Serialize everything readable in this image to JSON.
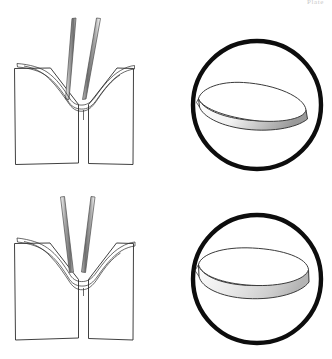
{
  "page": {
    "header_text": "Plate",
    "width": 332,
    "height": 359,
    "background_color": "#ffffff",
    "ink_color": "#2b2b2b",
    "outline_color": "#0d0d0d"
  },
  "figure": {
    "panels": [
      {
        "id": "panel-top-left",
        "name": "thin-lens-fold-diagram",
        "label": "",
        "description": "Forceps jaws folding a thin lens into a V between two blocks",
        "lens_thickness": "thin"
      },
      {
        "id": "panel-top-right",
        "name": "thin-lens-inset",
        "label": "",
        "description": "Circular inset showing oblique view of thin lens disc",
        "lens_thickness": "thin"
      },
      {
        "id": "panel-bottom-left",
        "name": "thick-lens-fold-diagram",
        "label": "",
        "description": "Forceps jaws folding a thick lens into a V between two blocks",
        "lens_thickness": "thick"
      },
      {
        "id": "panel-bottom-right",
        "name": "thick-lens-inset",
        "label": "",
        "description": "Circular inset showing oblique view of thick lens disc",
        "lens_thickness": "thick"
      }
    ],
    "insets": [
      {
        "id": "inset-top",
        "cx": 257,
        "cy": 105,
        "r": 65,
        "stroke_width": 4.4
      },
      {
        "id": "inset-bottom",
        "cx": 257,
        "cy": 279,
        "r": 65,
        "stroke_width": 4.4
      }
    ],
    "colors": {
      "paper": "#ffffff",
      "line": "#2b2b2b",
      "heavy_outline": "#0d0d0d",
      "instrument_shade": "#8d8d8d",
      "lens_shade": "#d9d9d9"
    }
  }
}
